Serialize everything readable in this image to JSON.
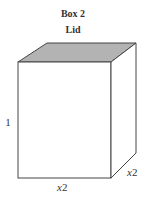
{
  "title": "Box 2",
  "subtitle": "Lid",
  "labels": {
    "height": "1",
    "width_var": "x",
    "width_sub": "2",
    "depth_var": "x",
    "depth_sub": "2"
  },
  "colors": {
    "lid_fill": "#b3b3b3",
    "edge": "#444444",
    "face": "#ffffff"
  }
}
